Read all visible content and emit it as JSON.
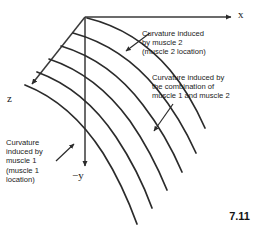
{
  "figure": {
    "number": "7.11",
    "background_color": "#ffffff",
    "ink_color": "#2b2b2b"
  },
  "axes": {
    "x": {
      "label": "x",
      "origin": [
        85,
        17
      ],
      "tip": [
        235,
        17
      ]
    },
    "z": {
      "label": "z",
      "origin": [
        85,
        17
      ],
      "tip": [
        28,
        88
      ]
    },
    "negy": {
      "label": "−y",
      "origin": [
        85,
        17
      ],
      "tip": [
        85,
        170
      ]
    }
  },
  "curves": {
    "count": 6,
    "description": "Family of curved lines fanning from the z-axis toward the lower right, representing spine curvature"
  },
  "annotations": [
    {
      "name": "muscle-2",
      "lines": [
        "Curvature induced",
        "by muscle 2",
        "(muscle 2 location)"
      ],
      "arrow_from": [
        150,
        33
      ],
      "arrow_to": [
        124,
        53
      ]
    },
    {
      "name": "combination",
      "lines": [
        "Curvature induced by",
        "the combination of",
        "muscle 1 and muscle 2"
      ],
      "arrow_from": [
        173,
        104
      ],
      "arrow_to": [
        152,
        134
      ]
    },
    {
      "name": "muscle-1",
      "lines": [
        "Curvature",
        "induced by",
        "muscle 1",
        "(muscle 1",
        "location)"
      ],
      "arrow_from": [
        56,
        161
      ],
      "arrow_to": [
        76,
        142
      ]
    }
  ]
}
